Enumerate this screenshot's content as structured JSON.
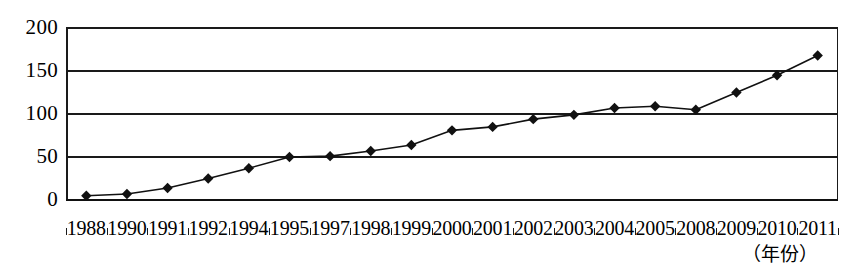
{
  "chart_data": {
    "type": "line",
    "title": "",
    "subtitle": "",
    "xlabel": "（年份）",
    "ylabel": "",
    "grid": true,
    "legend": false,
    "legend_position": "none",
    "marker": "diamond",
    "line_color": "#111111",
    "marker_color": "#111111",
    "ylim": [
      0,
      200
    ],
    "y_ticks": [
      "0",
      "50",
      "100",
      "150",
      "200"
    ],
    "y_tick_values": [
      0,
      50,
      100,
      150,
      200
    ],
    "categories": [
      "1988",
      "1990",
      "1991",
      "1992",
      "1994",
      "1995",
      "1997",
      "1998",
      "1999",
      "2000",
      "2001",
      "2002",
      "2003",
      "2004",
      "2005",
      "2008",
      "2009",
      "2010",
      "2011"
    ],
    "values": [
      5,
      7,
      14,
      25,
      37,
      50,
      51,
      57,
      64,
      81,
      85,
      94,
      99,
      107,
      109,
      105,
      125,
      145,
      168
    ],
    "series": [
      {
        "name": "series-1",
        "values": [
          5,
          7,
          14,
          25,
          37,
          50,
          51,
          57,
          64,
          81,
          85,
          94,
          99,
          107,
          109,
          105,
          125,
          145,
          168
        ]
      }
    ]
  },
  "axis": {
    "x_title": "（年份）"
  }
}
